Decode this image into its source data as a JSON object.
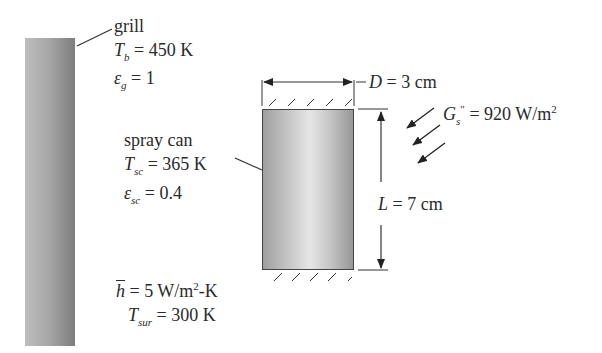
{
  "grill": {
    "label": "grill",
    "temp_symbol": "T",
    "temp_sub": "b",
    "temp_value": "= 450 K",
    "emis_symbol": "ε",
    "emis_sub": "g",
    "emis_value": "= 1"
  },
  "spray_can": {
    "label": "spray can",
    "temp_symbol": "T",
    "temp_sub": "sc",
    "temp_value": "= 365 K",
    "emis_symbol": "ε",
    "emis_sub": "sc",
    "emis_value": "= 0.4"
  },
  "convection": {
    "h_symbol": "h",
    "h_value": "= 5 W/m",
    "h_exp": "2",
    "h_unit_tail": "-K",
    "tsur_symbol": "T",
    "tsur_sub": "sur",
    "tsur_value": "= 300 K"
  },
  "dimensions": {
    "diameter_symbol": "D",
    "diameter_value": "= 3 cm",
    "length_symbol": "L",
    "length_value": "= 7 cm"
  },
  "solar": {
    "symbol": "G",
    "sub": "s",
    "prime": "″",
    "value": "= 920 W/m",
    "exp": "2"
  },
  "colors": {
    "line": "#333333",
    "text": "#2a2a2a"
  }
}
